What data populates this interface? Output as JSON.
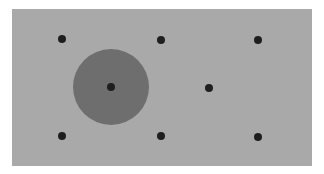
{
  "canvas": {
    "width": 324,
    "height": 174,
    "background": "#ffffff"
  },
  "panel": {
    "x": 12,
    "y": 9,
    "width": 300,
    "height": 157,
    "fill": "#a9a9a9"
  },
  "highlight_circle": {
    "cx": 111,
    "cy": 87,
    "r": 38,
    "fill": "#6e6e6e"
  },
  "dot_style": {
    "r": 4,
    "fill": "#1e1e1e"
  },
  "dots": [
    {
      "cx": 62,
      "cy": 39
    },
    {
      "cx": 161,
      "cy": 40
    },
    {
      "cx": 258,
      "cy": 40
    },
    {
      "cx": 111,
      "cy": 87
    },
    {
      "cx": 209,
      "cy": 88
    },
    {
      "cx": 62,
      "cy": 136
    },
    {
      "cx": 161,
      "cy": 136
    },
    {
      "cx": 258,
      "cy": 137
    }
  ]
}
